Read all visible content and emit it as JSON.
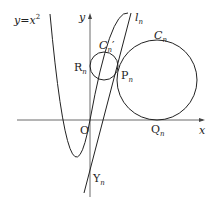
{
  "labels": {
    "curve": "y=x",
    "curve_exp": "2",
    "y_axis": "y",
    "x_axis": "x",
    "origin": "O",
    "line": "l",
    "line_sub": "n",
    "circle_big": "C",
    "circle_big_sub": "n",
    "circle_small": "C",
    "circle_small_sub": "n",
    "circle_small_prime": "′",
    "R": "R",
    "R_sub": "n",
    "P": "P",
    "P_sub": "n",
    "Q": "Q",
    "Q_sub": "n",
    "Y": "Y",
    "Y_sub": "n"
  },
  "colors": {
    "stroke": "#222222",
    "background": "#ffffff"
  }
}
